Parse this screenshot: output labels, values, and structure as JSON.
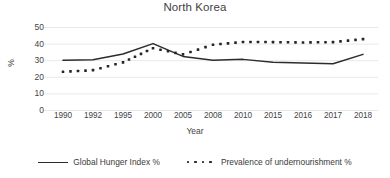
{
  "chart_data": {
    "type": "line",
    "title": "North Korea",
    "xlabel": "Year",
    "ylabel": "%",
    "categories": [
      "1990",
      "1992",
      "1995",
      "2000",
      "2005",
      "2008",
      "2010",
      "2015",
      "2016",
      "2017",
      "2018"
    ],
    "ylim": [
      0,
      50
    ],
    "yticks": [
      0,
      10,
      20,
      30,
      40,
      50
    ],
    "grid": true,
    "legend_position": "bottom",
    "series": [
      {
        "name": "Global Hunger Index %",
        "style": "solid",
        "values": [
          30.2,
          30.6,
          34.0,
          40.3,
          32.6,
          30.3,
          30.8,
          29.0,
          28.6,
          28.2,
          33.8
        ]
      },
      {
        "name": "Prevalence of undernourishment %",
        "style": "dotted",
        "values": [
          23.3,
          24.3,
          29.0,
          37.5,
          33.8,
          39.6,
          41.3,
          41.2,
          41.0,
          41.2,
          43.0
        ]
      }
    ]
  },
  "legend": {
    "items": [
      {
        "label": "Global Hunger Index %",
        "style": "solid"
      },
      {
        "label": "Prevalence of undernourishment %",
        "style": "dotted"
      }
    ]
  }
}
